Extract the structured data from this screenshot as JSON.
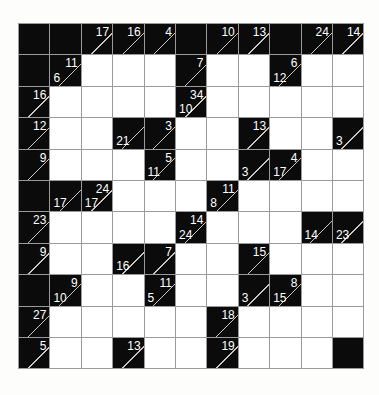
{
  "puzzle": {
    "name": "kakuro-grid",
    "type": "kakuro",
    "rows": 11,
    "cols": 11,
    "cell_size": 31.4,
    "colors": {
      "block": "#0b0b0b",
      "open": "#ffffff",
      "grid_line": "#9a9a9a",
      "clue_text": "#ffffff",
      "diagonal": "#c9c9c9",
      "page_background": "#fdfdfb"
    },
    "legend": {
      "across_position": "upper-right",
      "down_position": "lower-left"
    },
    "grid": [
      [
        {
          "t": "block"
        },
        {
          "t": "block"
        },
        {
          "t": "clue",
          "across": "17"
        },
        {
          "t": "clue",
          "across": "16"
        },
        {
          "t": "clue",
          "across": "4"
        },
        {
          "t": "block"
        },
        {
          "t": "clue",
          "across": "10"
        },
        {
          "t": "clue",
          "across": "13"
        },
        {
          "t": "block"
        },
        {
          "t": "clue",
          "across": "24"
        },
        {
          "t": "clue",
          "across": "14"
        }
      ],
      [
        {
          "t": "block"
        },
        {
          "t": "clue",
          "across": "11",
          "down": "6"
        },
        {
          "t": "open"
        },
        {
          "t": "open"
        },
        {
          "t": "open"
        },
        {
          "t": "clue",
          "across": "7"
        },
        {
          "t": "open"
        },
        {
          "t": "open"
        },
        {
          "t": "clue",
          "across": "6",
          "down": "12"
        },
        {
          "t": "open"
        },
        {
          "t": "open"
        }
      ],
      [
        {
          "t": "clue",
          "across": "16"
        },
        {
          "t": "open"
        },
        {
          "t": "open"
        },
        {
          "t": "open"
        },
        {
          "t": "open"
        },
        {
          "t": "clue",
          "across": "34",
          "down": "10"
        },
        {
          "t": "open"
        },
        {
          "t": "open"
        },
        {
          "t": "open"
        },
        {
          "t": "open"
        },
        {
          "t": "open"
        }
      ],
      [
        {
          "t": "clue",
          "across": "12"
        },
        {
          "t": "open"
        },
        {
          "t": "open"
        },
        {
          "t": "clue",
          "down": "21"
        },
        {
          "t": "clue",
          "across": "3"
        },
        {
          "t": "open"
        },
        {
          "t": "open"
        },
        {
          "t": "clue",
          "across": "13"
        },
        {
          "t": "open"
        },
        {
          "t": "open"
        },
        {
          "t": "clue",
          "down": "3"
        }
      ],
      [
        {
          "t": "clue",
          "across": "9"
        },
        {
          "t": "open"
        },
        {
          "t": "open"
        },
        {
          "t": "open"
        },
        {
          "t": "clue",
          "across": "5",
          "down": "11"
        },
        {
          "t": "open"
        },
        {
          "t": "open"
        },
        {
          "t": "clue",
          "down": "3"
        },
        {
          "t": "clue",
          "across": "4",
          "down": "17"
        },
        {
          "t": "open"
        },
        {
          "t": "open"
        }
      ],
      [
        {
          "t": "block"
        },
        {
          "t": "clue",
          "down": "17"
        },
        {
          "t": "clue",
          "across": "24",
          "down": "17"
        },
        {
          "t": "open"
        },
        {
          "t": "open"
        },
        {
          "t": "open"
        },
        {
          "t": "clue",
          "across": "11",
          "down": "8"
        },
        {
          "t": "open"
        },
        {
          "t": "open"
        },
        {
          "t": "open"
        },
        {
          "t": "open"
        }
      ],
      [
        {
          "t": "clue",
          "across": "23"
        },
        {
          "t": "open"
        },
        {
          "t": "open"
        },
        {
          "t": "open"
        },
        {
          "t": "open"
        },
        {
          "t": "clue",
          "across": "14",
          "down": "24"
        },
        {
          "t": "open"
        },
        {
          "t": "open"
        },
        {
          "t": "open"
        },
        {
          "t": "clue",
          "down": "14"
        },
        {
          "t": "clue",
          "down": "23"
        }
      ],
      [
        {
          "t": "clue",
          "across": "9"
        },
        {
          "t": "open"
        },
        {
          "t": "open"
        },
        {
          "t": "clue",
          "down": "16"
        },
        {
          "t": "clue",
          "across": "7"
        },
        {
          "t": "open"
        },
        {
          "t": "open"
        },
        {
          "t": "clue",
          "across": "15"
        },
        {
          "t": "open"
        },
        {
          "t": "open"
        },
        {
          "t": "open"
        }
      ],
      [
        {
          "t": "block"
        },
        {
          "t": "clue",
          "across": "9",
          "down": "10"
        },
        {
          "t": "open"
        },
        {
          "t": "open"
        },
        {
          "t": "clue",
          "across": "11",
          "down": "5"
        },
        {
          "t": "open"
        },
        {
          "t": "open"
        },
        {
          "t": "clue",
          "down": "3"
        },
        {
          "t": "clue",
          "across": "8",
          "down": "15"
        },
        {
          "t": "open"
        },
        {
          "t": "open"
        }
      ],
      [
        {
          "t": "clue",
          "across": "27"
        },
        {
          "t": "open"
        },
        {
          "t": "open"
        },
        {
          "t": "open"
        },
        {
          "t": "open"
        },
        {
          "t": "open"
        },
        {
          "t": "clue",
          "across": "18"
        },
        {
          "t": "open"
        },
        {
          "t": "open"
        },
        {
          "t": "open"
        },
        {
          "t": "open"
        }
      ],
      [
        {
          "t": "clue",
          "across": "5"
        },
        {
          "t": "open"
        },
        {
          "t": "open"
        },
        {
          "t": "clue",
          "across": "13"
        },
        {
          "t": "open"
        },
        {
          "t": "open"
        },
        {
          "t": "clue",
          "across": "19"
        },
        {
          "t": "open"
        },
        {
          "t": "open"
        },
        {
          "t": "open"
        },
        {
          "t": "block"
        }
      ]
    ]
  }
}
